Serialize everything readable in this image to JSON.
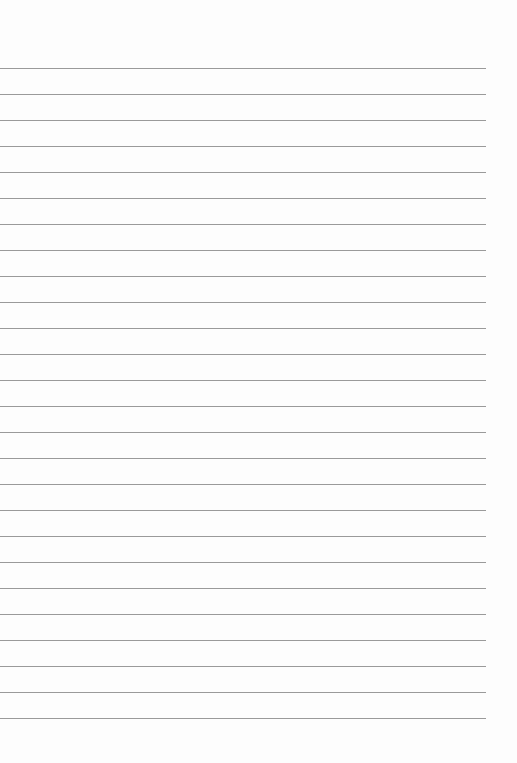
{
  "page": {
    "type": "lined-paper",
    "line_count": 26,
    "first_line_y": 68,
    "line_spacing": 26,
    "line_color": "#9a9a9a",
    "background": "#fdfdfd"
  }
}
